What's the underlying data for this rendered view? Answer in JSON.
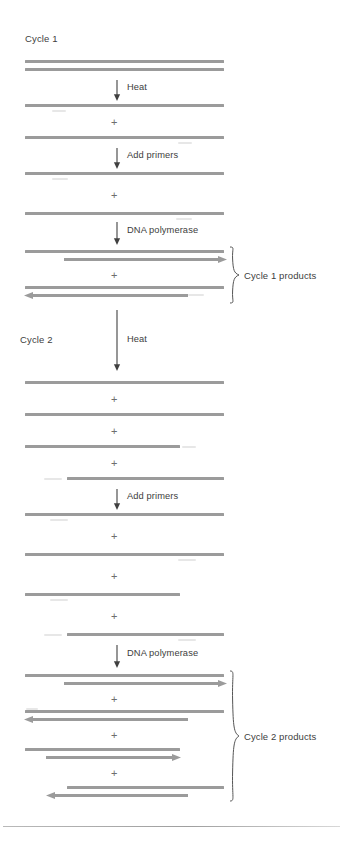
{
  "diagram": {
    "colors": {
      "strand": "#9b9b9b",
      "text": "#3d3d3d",
      "ghost": "#e3e3e3",
      "rule": "#9f9f9f"
    }
  },
  "cycles": [
    {
      "id": "cycle-1",
      "title": "Cycle 1",
      "steps": [
        {
          "id": "heat",
          "label": "Heat"
        },
        {
          "id": "add-primers",
          "label": "Add primers"
        },
        {
          "id": "dna-polymerase",
          "label": "DNA polymerase"
        }
      ],
      "products_label": "Cycle 1 products",
      "product_count": 2
    },
    {
      "id": "cycle-2",
      "title": "Cycle 2",
      "steps": [
        {
          "id": "heat",
          "label": "Heat"
        },
        {
          "id": "add-primers",
          "label": "Add primers"
        },
        {
          "id": "dna-polymerase",
          "label": "DNA polymerase"
        }
      ],
      "products_label": "Cycle 2 products",
      "product_count": 4
    }
  ],
  "symbols": {
    "plus": "+"
  },
  "stages": [
    {
      "id": "template-duplex",
      "caption": "Double-stranded template DNA",
      "strands": 2
    },
    {
      "id": "c1-denatured",
      "caption": "Two separated single strands",
      "strands": 2
    },
    {
      "id": "c1-primed",
      "caption": "Single strands with primers annealed",
      "strands": 2
    },
    {
      "id": "c1-products",
      "caption": "Two duplexes with newly synthesized strands",
      "strands": 4
    },
    {
      "id": "c2-denatured",
      "caption": "Four separated single strands",
      "strands": 4
    },
    {
      "id": "c2-primed",
      "caption": "Four single strands with primers annealed",
      "strands": 4
    },
    {
      "id": "c2-products",
      "caption": "Four duplexes with newly synthesized strands",
      "strands": 8
    }
  ]
}
